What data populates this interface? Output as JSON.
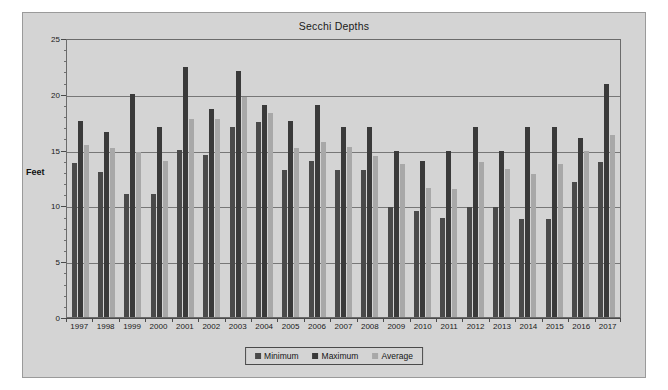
{
  "chart_data": {
    "type": "bar",
    "title": "Secchi Depths",
    "xlabel": "",
    "ylabel": "Feet",
    "ylim": [
      0,
      25
    ],
    "yticks": [
      0,
      5,
      10,
      15,
      20,
      25
    ],
    "grid": true,
    "legend_position": "bottom",
    "categories": [
      "1997",
      "1998",
      "1999",
      "2000",
      "2001",
      "2002",
      "2003",
      "2004",
      "2005",
      "2006",
      "2007",
      "2008",
      "2009",
      "2010",
      "2011",
      "2012",
      "2013",
      "2014",
      "2015",
      "2016",
      "2017"
    ],
    "series": [
      {
        "name": "Minimum",
        "color": "#4a4a4a",
        "values": [
          13.8,
          13.0,
          11.0,
          11.0,
          15.0,
          14.5,
          17.0,
          17.5,
          13.2,
          14.0,
          13.2,
          13.2,
          9.9,
          9.5,
          8.9,
          9.9,
          9.9,
          8.8,
          8.8,
          12.1,
          13.9
        ]
      },
      {
        "name": "Maximum",
        "color": "#3a3a3a",
        "values": [
          17.6,
          16.6,
          20.0,
          17.0,
          22.4,
          18.6,
          22.0,
          19.0,
          17.6,
          19.0,
          17.0,
          17.0,
          14.9,
          14.0,
          14.9,
          17.0,
          14.9,
          17.0,
          17.0,
          16.0,
          20.9
        ]
      },
      {
        "name": "Average",
        "color": "#a8a8a8",
        "values": [
          15.4,
          15.1,
          14.8,
          14.0,
          17.7,
          17.7,
          19.7,
          18.3,
          15.1,
          15.7,
          15.2,
          14.4,
          13.7,
          11.6,
          11.5,
          13.9,
          13.3,
          12.8,
          13.7,
          14.9,
          16.3
        ]
      }
    ]
  },
  "legend": {
    "items": [
      {
        "label": "Minimum"
      },
      {
        "label": "Maximum"
      },
      {
        "label": "Average"
      }
    ]
  }
}
